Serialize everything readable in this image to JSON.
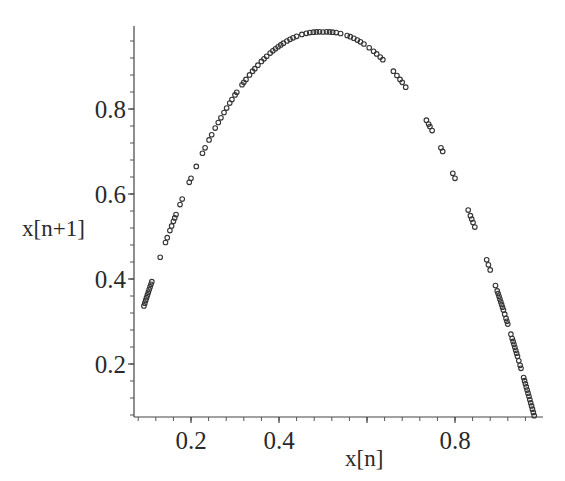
{
  "chart_data": {
    "type": "scatter",
    "title": "",
    "xlabel": "x[n]",
    "ylabel": "x[n+1]",
    "xlim": [
      0.077,
      0.998
    ],
    "ylim": [
      0.075,
      0.995
    ],
    "x_ticks": [
      0.2,
      0.4,
      0.8
    ],
    "x_tick_labels": [
      "0.2",
      "0.4",
      "0.8"
    ],
    "y_ticks": [
      0.2,
      0.4,
      0.6,
      0.8
    ],
    "y_tick_labels": [
      "0.2",
      "0.4",
      "0.6",
      "0.8"
    ],
    "grid": false,
    "legend": null,
    "marker": "open-circle",
    "marker_color": "#333333",
    "relation": "x[n+1] = 4 * x[n] * (1 - x[n])",
    "series": [
      {
        "name": "logistic map iterates",
        "x": [
          0.093,
          0.095,
          0.097,
          0.099,
          0.101,
          0.103,
          0.105,
          0.107,
          0.109,
          0.111,
          0.13,
          0.142,
          0.146,
          0.152,
          0.156,
          0.16,
          0.163,
          0.166,
          0.175,
          0.18,
          0.196,
          0.2,
          0.212,
          0.226,
          0.232,
          0.241,
          0.247,
          0.255,
          0.262,
          0.268,
          0.275,
          0.281,
          0.288,
          0.293,
          0.3,
          0.304,
          0.316,
          0.32,
          0.325,
          0.333,
          0.34,
          0.345,
          0.352,
          0.36,
          0.366,
          0.372,
          0.38,
          0.386,
          0.392,
          0.398,
          0.404,
          0.41,
          0.418,
          0.425,
          0.432,
          0.44,
          0.452,
          0.462,
          0.47,
          0.478,
          0.485,
          0.492,
          0.5,
          0.508,
          0.515,
          0.522,
          0.53,
          0.54,
          0.555,
          0.562,
          0.57,
          0.578,
          0.585,
          0.593,
          0.605,
          0.615,
          0.622,
          0.63,
          0.636,
          0.66,
          0.668,
          0.675,
          0.68,
          0.688,
          0.735,
          0.74,
          0.743,
          0.748,
          0.768,
          0.772,
          0.795,
          0.8,
          0.83,
          0.835,
          0.838,
          0.841,
          0.845,
          0.872,
          0.876,
          0.88,
          0.892,
          0.896,
          0.898,
          0.9,
          0.902,
          0.904,
          0.906,
          0.908,
          0.91,
          0.913,
          0.916,
          0.918,
          0.92,
          0.927,
          0.93,
          0.932,
          0.934,
          0.936,
          0.938,
          0.94,
          0.942,
          0.945,
          0.948,
          0.95,
          0.956,
          0.958,
          0.96,
          0.962,
          0.964,
          0.966,
          0.968,
          0.97,
          0.972,
          0.974,
          0.976,
          0.978,
          0.98
        ]
      }
    ]
  }
}
